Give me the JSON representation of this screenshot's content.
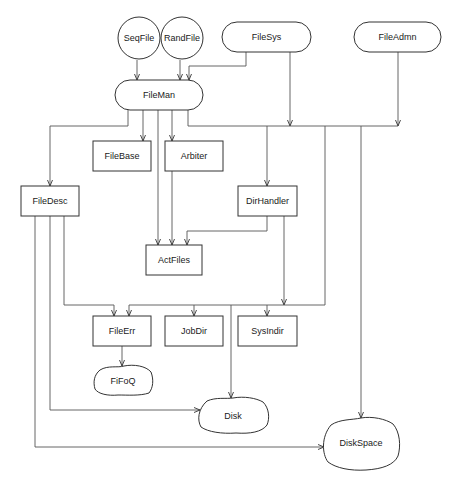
{
  "diagram": {
    "type": "module-dependency-diagram",
    "nodes": [
      {
        "id": "seqfile",
        "label": "SeqFile",
        "shape": "circle"
      },
      {
        "id": "randfile",
        "label": "RandFile",
        "shape": "circle"
      },
      {
        "id": "filesys",
        "label": "FileSys",
        "shape": "pill"
      },
      {
        "id": "fileadmn",
        "label": "FileAdmn",
        "shape": "pill"
      },
      {
        "id": "fileman",
        "label": "FileMan",
        "shape": "pill"
      },
      {
        "id": "filebase",
        "label": "FileBase",
        "shape": "rect"
      },
      {
        "id": "arbiter",
        "label": "Arbiter",
        "shape": "rect"
      },
      {
        "id": "filedesc",
        "label": "FileDesc",
        "shape": "rect"
      },
      {
        "id": "dirhandler",
        "label": "DirHandler",
        "shape": "rect"
      },
      {
        "id": "actfiles",
        "label": "ActFiles",
        "shape": "rect"
      },
      {
        "id": "fileerr",
        "label": "FileErr",
        "shape": "rect"
      },
      {
        "id": "jobdir",
        "label": "JobDir",
        "shape": "rect"
      },
      {
        "id": "sysindir",
        "label": "SysIndir",
        "shape": "rect"
      },
      {
        "id": "fifoq",
        "label": "FiFoQ",
        "shape": "blob"
      },
      {
        "id": "disk",
        "label": "Disk",
        "shape": "blob"
      },
      {
        "id": "diskspace",
        "label": "DiskSpace",
        "shape": "blob"
      }
    ],
    "edges": [
      {
        "from": "SeqFile",
        "to": "FileMan"
      },
      {
        "from": "RandFile",
        "to": "FileMan"
      },
      {
        "from": "FileSys",
        "to": "FileMan"
      },
      {
        "from": "FileSys",
        "to": "bus"
      },
      {
        "from": "FileAdmn",
        "to": "bus"
      },
      {
        "from": "FileMan",
        "to": "FileDesc"
      },
      {
        "from": "FileMan",
        "to": "FileBase"
      },
      {
        "from": "FileMan",
        "to": "Arbiter"
      },
      {
        "from": "FileMan",
        "to": "ActFiles"
      },
      {
        "from": "FileMan",
        "to": "bus"
      },
      {
        "from": "Arbiter",
        "to": "ActFiles"
      },
      {
        "from": "bus",
        "to": "DirHandler"
      },
      {
        "from": "bus",
        "to": "FileErr / JobDir / SysIndir / Disk"
      },
      {
        "from": "bus",
        "to": "DiskSpace"
      },
      {
        "from": "DirHandler",
        "to": "ActFiles"
      },
      {
        "from": "DirHandler",
        "to": "SysIndir"
      },
      {
        "from": "FileDesc",
        "to": "FileErr"
      },
      {
        "from": "FileDesc",
        "to": "Disk"
      },
      {
        "from": "FileDesc",
        "to": "DiskSpace"
      },
      {
        "from": "FileErr",
        "to": "FiFoQ"
      }
    ]
  },
  "labels": {
    "seqfile": "SeqFile",
    "randfile": "RandFile",
    "filesys": "FileSys",
    "fileadmn": "FileAdmn",
    "fileman": "FileMan",
    "filebase": "FileBase",
    "arbiter": "Arbiter",
    "filedesc": "FileDesc",
    "dirhandler": "DirHandler",
    "actfiles": "ActFiles",
    "fileerr": "FileErr",
    "jobdir": "JobDir",
    "sysindir": "SysIndir",
    "fifoq": "FiFoQ",
    "disk": "Disk",
    "diskspace": "DiskSpace"
  }
}
